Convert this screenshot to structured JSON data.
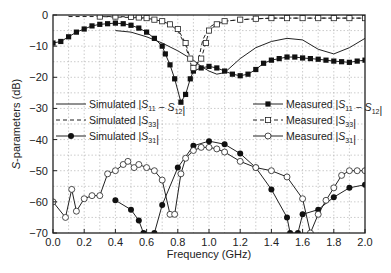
{
  "chart_data": {
    "type": "line",
    "title": "",
    "xlabel": "Frequency (GHz)",
    "ylabel": "S-parameters (dB)",
    "xlim": [
      0.0,
      2.0
    ],
    "ylim": [
      -70,
      0
    ],
    "xticks": [
      "0.0",
      "0.2",
      "0.4",
      "0.6",
      "0.8",
      "1.0",
      "1.2",
      "1.4",
      "1.6",
      "1.8",
      "2.0"
    ],
    "yticks": [
      "0",
      "-10",
      "-20",
      "-30",
      "-40",
      "-50",
      "-60",
      "-70"
    ],
    "grid": true,
    "legend_left": [
      "Simulated |S11 − S12|",
      "Simulated |S33|",
      "Simulated |S31|"
    ],
    "legend_right": [
      "Measured |S11 − S12|",
      "Measured |S33|",
      "Measured |S31|"
    ],
    "series": [
      {
        "name": "Simulated |S11 − S12|",
        "style": "solid",
        "marker": "none",
        "x": [
          0.4,
          0.5,
          0.6,
          0.7,
          0.8,
          0.9,
          0.95,
          1.0,
          1.05,
          1.1,
          1.2,
          1.3,
          1.4,
          1.5,
          1.6,
          1.7,
          1.8,
          1.9,
          2.0
        ],
        "y": [
          -5,
          -5.5,
          -7,
          -9,
          -11.5,
          -14.5,
          -16.5,
          -18,
          -19,
          -18.5,
          -14,
          -10.5,
          -8.5,
          -7.5,
          -8,
          -11,
          -12.5,
          -10.5,
          -7.5
        ]
      },
      {
        "name": "Simulated |S33|",
        "style": "dashed",
        "marker": "none",
        "x": [
          0.1,
          0.3,
          0.5,
          0.6,
          0.7,
          0.75,
          0.8,
          0.85,
          0.88,
          0.9,
          0.93,
          0.96,
          1.0,
          1.05,
          1.1,
          1.2,
          1.4,
          1.6,
          1.8,
          2.0
        ],
        "y": [
          -0.5,
          -0.5,
          -0.8,
          -1.2,
          -2,
          -3,
          -5,
          -10,
          -15,
          -19,
          -15,
          -8,
          -4,
          -2.5,
          -2,
          -1.5,
          -1,
          -1,
          -1,
          -1
        ]
      },
      {
        "name": "Simulated |S31|",
        "style": "solid",
        "marker": "filled-circle",
        "x": [
          0.4,
          0.5,
          0.55,
          0.58,
          0.65,
          0.7,
          0.8,
          0.9,
          1.0,
          1.1,
          1.2,
          1.3,
          1.4,
          1.5,
          1.52,
          1.57,
          1.6,
          1.7,
          1.8,
          1.9,
          2.0
        ],
        "y": [
          -59.5,
          -62.5,
          -66,
          -70,
          -70,
          -61,
          -49,
          -42,
          -40.5,
          -41.5,
          -44.5,
          -49,
          -56,
          -65,
          -70,
          -70,
          -64,
          -62.5,
          -58.5,
          -55.5,
          -54.5
        ]
      },
      {
        "name": "Measured |S11 − S12|",
        "style": "solid",
        "marker": "filled-square",
        "x": [
          0.0,
          0.05,
          0.1,
          0.15,
          0.2,
          0.25,
          0.3,
          0.35,
          0.4,
          0.45,
          0.5,
          0.55,
          0.6,
          0.65,
          0.7,
          0.72,
          0.75,
          0.78,
          0.82,
          0.85,
          0.88,
          0.9,
          0.95,
          1.0,
          1.05,
          1.1,
          1.15,
          1.2,
          1.25,
          1.3,
          1.35,
          1.4,
          1.45,
          1.5,
          1.55,
          1.6,
          1.65,
          1.7,
          1.75,
          1.8,
          1.85,
          1.9,
          1.95,
          2.0
        ],
        "y": [
          -9,
          -8.5,
          -7,
          -5.5,
          -4.5,
          -3.5,
          -3,
          -2.8,
          -2.6,
          -2.8,
          -3.3,
          -4.2,
          -5.5,
          -7.5,
          -10,
          -12.5,
          -16,
          -20.5,
          -28,
          -25.5,
          -20.5,
          -18,
          -17,
          -16.5,
          -17,
          -18,
          -19,
          -19.5,
          -19,
          -17.5,
          -15.5,
          -14.5,
          -14,
          -13.5,
          -13.5,
          -13.8,
          -14,
          -14.2,
          -14.5,
          -14.8,
          -15,
          -15.2,
          -14.8,
          -14.5
        ]
      },
      {
        "name": "Measured |S33|",
        "style": "dashed",
        "marker": "open-square",
        "x": [
          0.3,
          0.4,
          0.5,
          0.55,
          0.6,
          0.65,
          0.7,
          0.75,
          0.8,
          0.85,
          0.88,
          0.9,
          0.95,
          0.98,
          1.0,
          1.05,
          1.1,
          1.2,
          1.3,
          1.4,
          1.5,
          1.6,
          1.7,
          1.8,
          1.9,
          2.0
        ],
        "y": [
          -0.5,
          -0.5,
          -0.6,
          -0.8,
          -1,
          -1.5,
          -2,
          -3,
          -4.5,
          -9,
          -14,
          -17,
          -14,
          -9,
          -5,
          -3,
          -2,
          -1.5,
          -1.2,
          -1,
          -1,
          -1,
          -1,
          -1,
          -1,
          -1
        ]
      },
      {
        "name": "Measured |S31|",
        "style": "solid",
        "marker": "open-circle",
        "x": [
          0.0,
          0.08,
          0.12,
          0.15,
          0.2,
          0.25,
          0.3,
          0.35,
          0.4,
          0.45,
          0.48,
          0.52,
          0.55,
          0.6,
          0.65,
          0.7,
          0.75,
          0.78,
          0.82,
          0.85,
          0.9,
          0.95,
          1.0,
          1.05,
          1.1,
          1.2,
          1.3,
          1.4,
          1.5,
          1.6,
          1.65,
          1.7,
          1.75,
          1.8,
          1.85,
          1.9,
          1.95,
          2.0
        ],
        "y": [
          -60,
          -65,
          -56,
          -63,
          -59,
          -58,
          -58,
          -51,
          -50,
          -48,
          -47,
          -49,
          -48,
          -49,
          -50,
          -53,
          -64,
          -64,
          -51,
          -46,
          -43.5,
          -42.5,
          -42.5,
          -43,
          -44,
          -47,
          -49,
          -50,
          -52,
          -59,
          -70,
          -64,
          -59.5,
          -55.5,
          -51.5,
          -50,
          -50,
          -50
        ]
      }
    ]
  }
}
